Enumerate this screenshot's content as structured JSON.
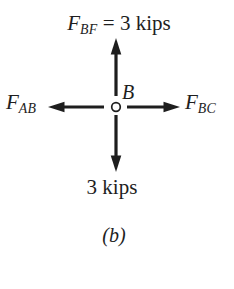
{
  "figure": {
    "type": "free-body-diagram",
    "colors": {
      "ink": "#1e1e1e",
      "background": "#ffffff"
    },
    "joint": {
      "label": "B"
    },
    "forces": {
      "up": {
        "symbol": "F",
        "subscript": "BF",
        "value": " = 3 kips"
      },
      "left": {
        "symbol": "F",
        "subscript": "AB"
      },
      "right": {
        "symbol": "F",
        "subscript": "BC"
      },
      "down": {
        "label": "3 kips"
      }
    },
    "caption": "(b)"
  }
}
